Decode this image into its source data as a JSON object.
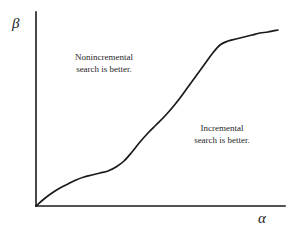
{
  "figure": {
    "width": 296,
    "height": 237,
    "background": "#ffffff",
    "ink_color": "#1a1a1a"
  },
  "axes": {
    "y_label": "β",
    "x_label": "α",
    "origin": [
      36,
      206
    ],
    "y_axis_top": [
      36,
      12
    ],
    "x_axis_right": [
      285,
      206
    ],
    "ticks": [],
    "grid": false
  },
  "annotations": [
    {
      "name": "nonincremental-region",
      "line1": "Nonincremental",
      "line2": "search is better.",
      "position": "upper-left"
    },
    {
      "name": "incremental-region",
      "line1": "Incremental",
      "line2": "search is better.",
      "position": "lower-right"
    }
  ],
  "chart_data": {
    "type": "line",
    "title": "",
    "xlabel": "α",
    "ylabel": "β",
    "xlim": [
      36,
      285
    ],
    "ylim": [
      206,
      12
    ],
    "grid": false,
    "legend": null,
    "series": [
      {
        "name": "boundary-curve",
        "comment": "Monotone increasing S-shaped boundary separating the nonincremental-better region (above-left) from the incremental-better region (below-right). Coordinates are in screenshot pixel space: x rightward, y downward.",
        "points": [
          [
            36,
            206
          ],
          [
            44,
            199
          ],
          [
            52,
            193
          ],
          [
            60,
            188
          ],
          [
            68,
            184
          ],
          [
            76,
            180
          ],
          [
            84,
            177
          ],
          [
            92,
            175
          ],
          [
            100,
            173
          ],
          [
            108,
            171
          ],
          [
            116,
            167
          ],
          [
            124,
            161
          ],
          [
            132,
            152
          ],
          [
            140,
            142
          ],
          [
            148,
            133
          ],
          [
            156,
            125
          ],
          [
            164,
            117
          ],
          [
            172,
            108
          ],
          [
            180,
            98
          ],
          [
            188,
            87
          ],
          [
            196,
            76
          ],
          [
            204,
            65
          ],
          [
            212,
            54
          ],
          [
            220,
            45
          ],
          [
            228,
            41
          ],
          [
            236,
            39
          ],
          [
            244,
            37
          ],
          [
            252,
            35
          ],
          [
            260,
            33
          ],
          [
            268,
            32
          ],
          [
            278,
            30
          ]
        ]
      }
    ]
  }
}
